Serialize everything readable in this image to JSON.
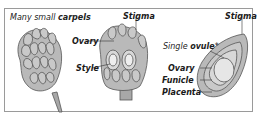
{
  "diagram": {
    "panels": [
      {
        "caption_prefix": "Many small ",
        "caption_bold": "carpels"
      },
      {
        "title": "Stigma",
        "labels": [
          "Ovary",
          "Style"
        ]
      },
      {
        "title": "Stigma",
        "caption_prefix": "Single ",
        "caption_bold": "ovule",
        "caption_suffix": "*",
        "labels": [
          "Ovary",
          "Funicle",
          "Placenta"
        ]
      }
    ],
    "colors": {
      "fill": "#b9b9b9",
      "fill_light": "#d8d8d8",
      "stroke": "#555555",
      "frame": "#9a9a9a"
    }
  }
}
